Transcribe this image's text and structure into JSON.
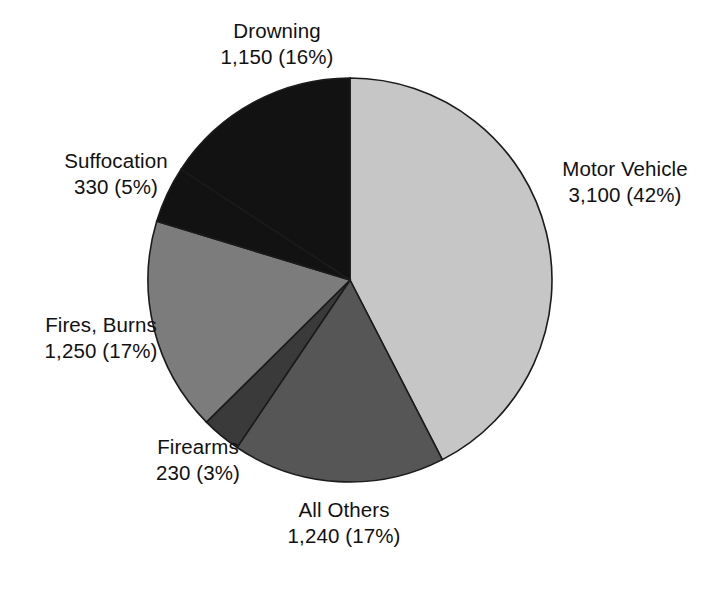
{
  "chart_data": {
    "type": "pie",
    "title": "",
    "subtitle": "",
    "xlabel": "",
    "ylabel": "",
    "legend_position": "none",
    "grid": false,
    "start_angle_deg": 0,
    "direction": "clockwise",
    "total": 7300,
    "categories": [
      "Motor Vehicle",
      "All Others",
      "Firearms",
      "Fires, Burns",
      "Suffocation",
      "Drowning"
    ],
    "values": [
      3100,
      1240,
      230,
      1250,
      330,
      1150
    ],
    "percents": [
      42,
      17,
      3,
      17,
      5,
      16
    ],
    "value_labels": [
      "3,100",
      "1,240",
      "230",
      "1,250",
      "330",
      "1,150"
    ],
    "percent_labels": [
      "(42%)",
      "(17%)",
      "(3%)",
      "(17%)",
      "(5%)",
      "(16%)"
    ],
    "colors": [
      "#c6c6c6",
      "#565656",
      "#3a3a3a",
      "#7c7c7c",
      "#121212",
      "#121212"
    ],
    "slices": [
      {
        "name": "Motor Vehicle",
        "value": 3100,
        "percent": 42,
        "label_name": "Motor Vehicle",
        "label_value": "3,100 (42%)",
        "color": "#c6c6c6",
        "start_deg": 0,
        "end_deg": 152.8
      },
      {
        "name": "All Others",
        "value": 1240,
        "percent": 17,
        "label_name": "All Others",
        "label_value": "1,240 (17%)",
        "color": "#565656",
        "start_deg": 152.8,
        "end_deg": 214.0
      },
      {
        "name": "Firearms",
        "value": 230,
        "percent": 3,
        "label_name": "Firearms",
        "label_value": "230 (3%)",
        "color": "#3a3a3a",
        "start_deg": 214.0,
        "end_deg": 225.3
      },
      {
        "name": "Fires, Burns",
        "value": 1250,
        "percent": 17,
        "label_name": "Fires, Burns",
        "label_value": "1,250 (17%)",
        "color": "#7c7c7c",
        "start_deg": 225.3,
        "end_deg": 286.9
      },
      {
        "name": "Suffocation",
        "value": 330,
        "percent": 5,
        "label_name": "Suffocation",
        "label_value": "330 (5%)",
        "color": "#121212",
        "start_deg": 286.9,
        "end_deg": 303.2
      },
      {
        "name": "Drowning",
        "value": 1150,
        "percent": 16,
        "label_name": "Drowning",
        "label_value": "1,150 (16%)",
        "color": "#121212",
        "start_deg": 303.2,
        "end_deg": 360.0
      }
    ],
    "geometry": {
      "center_x": 350,
      "center_y": 280,
      "radius": 202
    }
  }
}
